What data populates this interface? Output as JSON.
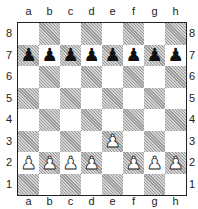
{
  "files": [
    "a",
    "b",
    "c",
    "d",
    "e",
    "f",
    "g",
    "h"
  ],
  "ranks": [
    "8",
    "7",
    "6",
    "5",
    "4",
    "3",
    "2",
    "1"
  ],
  "colors": {
    "light_square": "#ffffff",
    "dark_square": "#b8b8b8",
    "border": "#222222"
  },
  "pieces": [
    {
      "square": "a7",
      "color": "black",
      "type": "pawn",
      "glyph": "♟"
    },
    {
      "square": "b7",
      "color": "black",
      "type": "pawn",
      "glyph": "♟"
    },
    {
      "square": "c7",
      "color": "black",
      "type": "pawn",
      "glyph": "♟"
    },
    {
      "square": "d7",
      "color": "black",
      "type": "pawn",
      "glyph": "♟"
    },
    {
      "square": "e7",
      "color": "black",
      "type": "pawn",
      "glyph": "♟"
    },
    {
      "square": "f7",
      "color": "black",
      "type": "pawn",
      "glyph": "♟"
    },
    {
      "square": "g7",
      "color": "black",
      "type": "pawn",
      "glyph": "♟"
    },
    {
      "square": "h7",
      "color": "black",
      "type": "pawn",
      "glyph": "♟"
    },
    {
      "square": "a2",
      "color": "white",
      "type": "pawn",
      "glyph": "♟"
    },
    {
      "square": "b2",
      "color": "white",
      "type": "pawn",
      "glyph": "♟"
    },
    {
      "square": "c2",
      "color": "white",
      "type": "pawn",
      "glyph": "♟"
    },
    {
      "square": "d2",
      "color": "white",
      "type": "pawn",
      "glyph": "♟"
    },
    {
      "square": "e3",
      "color": "white",
      "type": "pawn",
      "glyph": "♟"
    },
    {
      "square": "f2",
      "color": "white",
      "type": "pawn",
      "glyph": "♟"
    },
    {
      "square": "g2",
      "color": "white",
      "type": "pawn",
      "glyph": "♟"
    },
    {
      "square": "h2",
      "color": "white",
      "type": "pawn",
      "glyph": "♟"
    }
  ]
}
